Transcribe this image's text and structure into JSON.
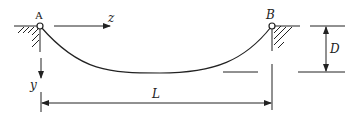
{
  "diagram": {
    "type": "hanging cable / catenary",
    "labels": {
      "support_a": "A",
      "support_b": "B",
      "axis_z": "z",
      "axis_y": "y",
      "span": "L",
      "sag": "D"
    },
    "colors": {
      "stroke": "#222222",
      "background": "#ffffff"
    }
  }
}
